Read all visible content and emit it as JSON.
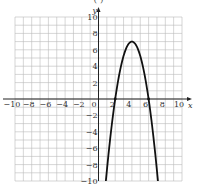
{
  "caption": "( )",
  "chart_data": {
    "type": "line",
    "title": "",
    "xlabel": "x",
    "ylabel": "y",
    "xlim": [
      -10,
      10
    ],
    "ylim": [
      -10,
      10
    ],
    "grid": true,
    "grid_step": 1,
    "x_ticks": [
      -10,
      -8,
      -6,
      -4,
      -2,
      0,
      2,
      4,
      6,
      8,
      10
    ],
    "y_ticks": [
      -10,
      -8,
      -6,
      -4,
      -2,
      2,
      4,
      6,
      8,
      10
    ],
    "series": [
      {
        "name": "parabola",
        "equation": "y = -1.75(x - 4)^2 + 7",
        "vertex": [
          4,
          7
        ],
        "x_intercepts": [
          2,
          6
        ],
        "x": [
          0.88,
          1.5,
          2,
          2.5,
          3,
          3.5,
          4,
          4.5,
          5,
          5.5,
          6,
          6.5,
          7.12
        ],
        "y": [
          -10,
          -3.94,
          0,
          3.06,
          5.25,
          6.56,
          7,
          6.56,
          5.25,
          3.06,
          0,
          -3.94,
          -10
        ]
      }
    ],
    "marked_points": [
      [
        2,
        0
      ],
      [
        6,
        0
      ]
    ]
  }
}
